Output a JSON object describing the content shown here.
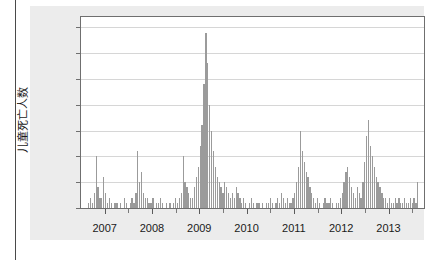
{
  "chart_data": {
    "type": "bar",
    "title": "",
    "subtitle": "",
    "xlabel": "",
    "ylabel": "儿童死亡人数",
    "ylim": [
      0,
      37
    ],
    "xlim": [
      2006.5,
      2013.75
    ],
    "grid": true,
    "legend": null,
    "bar_color": "#9b9b9b",
    "panel_bg": "#ffffff",
    "figure_bg": "#ececec",
    "gridline_color": "#d6d6d6",
    "axis_color": "#6f6f6f",
    "y_ticks": [
      0,
      5,
      10,
      15,
      20,
      25,
      30,
      35
    ],
    "x_ticks": [
      2007,
      2008,
      2009,
      2010,
      2011,
      2012,
      2013
    ],
    "x_tick_labels": [
      "2007",
      "2008",
      "2009",
      "2010",
      "2011",
      "2012",
      "2013"
    ],
    "note": "Dense daily time-series of child deaths; x values are fractional years, y values are counts.",
    "x": [
      2006.62,
      2006.66,
      2006.7,
      2006.74,
      2006.78,
      2006.82,
      2006.86,
      2006.9,
      2006.94,
      2006.98,
      2007.02,
      2007.06,
      2007.1,
      2007.14,
      2007.18,
      2007.22,
      2007.26,
      2007.3,
      2007.34,
      2007.38,
      2007.42,
      2007.46,
      2007.5,
      2007.54,
      2007.58,
      2007.62,
      2007.66,
      2007.7,
      2007.74,
      2007.78,
      2007.82,
      2007.86,
      2007.9,
      2007.94,
      2007.98,
      2008.02,
      2008.06,
      2008.1,
      2008.14,
      2008.18,
      2008.22,
      2008.26,
      2008.3,
      2008.34,
      2008.38,
      2008.42,
      2008.46,
      2008.5,
      2008.54,
      2008.58,
      2008.62,
      2008.66,
      2008.7,
      2008.74,
      2008.78,
      2008.82,
      2008.86,
      2008.9,
      2008.94,
      2008.98,
      2009.02,
      2009.06,
      2009.1,
      2009.14,
      2009.18,
      2009.22,
      2009.26,
      2009.3,
      2009.34,
      2009.38,
      2009.42,
      2009.46,
      2009.5,
      2009.54,
      2009.58,
      2009.62,
      2009.66,
      2009.7,
      2009.74,
      2009.78,
      2009.82,
      2009.86,
      2009.9,
      2009.94,
      2009.98,
      2010.02,
      2010.06,
      2010.1,
      2010.14,
      2010.18,
      2010.22,
      2010.26,
      2010.3,
      2010.34,
      2010.38,
      2010.42,
      2010.46,
      2010.5,
      2010.54,
      2010.58,
      2010.62,
      2010.66,
      2010.7,
      2010.74,
      2010.78,
      2010.82,
      2010.86,
      2010.9,
      2010.94,
      2010.98,
      2011.02,
      2011.06,
      2011.1,
      2011.14,
      2011.18,
      2011.22,
      2011.26,
      2011.3,
      2011.34,
      2011.38,
      2011.42,
      2011.46,
      2011.5,
      2011.54,
      2011.58,
      2011.62,
      2011.66,
      2011.7,
      2011.74,
      2011.78,
      2011.82,
      2011.86,
      2011.9,
      2011.94,
      2011.98,
      2012.02,
      2012.06,
      2012.1,
      2012.14,
      2012.18,
      2012.22,
      2012.26,
      2012.3,
      2012.34,
      2012.38,
      2012.42,
      2012.46,
      2012.5,
      2012.54,
      2012.58,
      2012.62,
      2012.66,
      2012.7,
      2012.74,
      2012.78,
      2012.82,
      2012.86,
      2012.9,
      2012.94,
      2012.98,
      2013.02,
      2013.06,
      2013.1,
      2013.14,
      2013.18,
      2013.22,
      2013.26,
      2013.3,
      2013.34,
      2013.38,
      2013.42,
      2013.46,
      2013.5,
      2013.54,
      2013.58,
      2013.62
    ],
    "values": [
      0,
      1,
      2,
      1,
      3,
      10,
      4,
      2,
      2,
      6,
      3,
      1,
      2,
      1,
      0,
      1,
      1,
      0,
      1,
      0,
      2,
      1,
      0,
      1,
      2,
      1,
      3,
      11,
      5,
      7,
      3,
      2,
      2,
      1,
      1,
      2,
      0,
      1,
      1,
      2,
      1,
      0,
      1,
      0,
      1,
      0,
      1,
      2,
      1,
      2,
      3,
      10,
      5,
      4,
      3,
      2,
      2,
      4,
      6,
      8,
      12,
      16,
      24,
      34,
      28,
      20,
      15,
      11,
      8,
      6,
      5,
      4,
      3,
      5,
      4,
      3,
      2,
      3,
      2,
      4,
      3,
      2,
      1,
      2,
      1,
      0,
      1,
      2,
      1,
      0,
      1,
      1,
      0,
      1,
      0,
      1,
      1,
      2,
      1,
      0,
      1,
      2,
      1,
      3,
      2,
      1,
      2,
      1,
      1,
      2,
      3,
      5,
      8,
      15,
      11,
      9,
      7,
      6,
      4,
      3,
      2,
      1,
      2,
      1,
      0,
      1,
      2,
      1,
      1,
      2,
      1,
      0,
      1,
      1,
      2,
      3,
      5,
      7,
      8,
      6,
      4,
      3,
      2,
      4,
      3,
      2,
      5,
      9,
      14,
      17,
      12,
      10,
      8,
      6,
      5,
      4,
      3,
      2,
      2,
      1,
      2,
      1,
      1,
      2,
      1,
      2,
      1,
      1,
      2,
      1,
      1,
      2,
      1,
      2,
      1,
      5
    ]
  },
  "y_axis": {
    "title": "儿童死亡人数",
    "ticks": [
      "0",
      "5",
      "10",
      "15",
      "20",
      "25",
      "30",
      "35"
    ]
  },
  "x_axis": {
    "ticks": [
      "2007",
      "2008",
      "2009",
      "2010",
      "2011",
      "2012",
      "2013"
    ]
  }
}
